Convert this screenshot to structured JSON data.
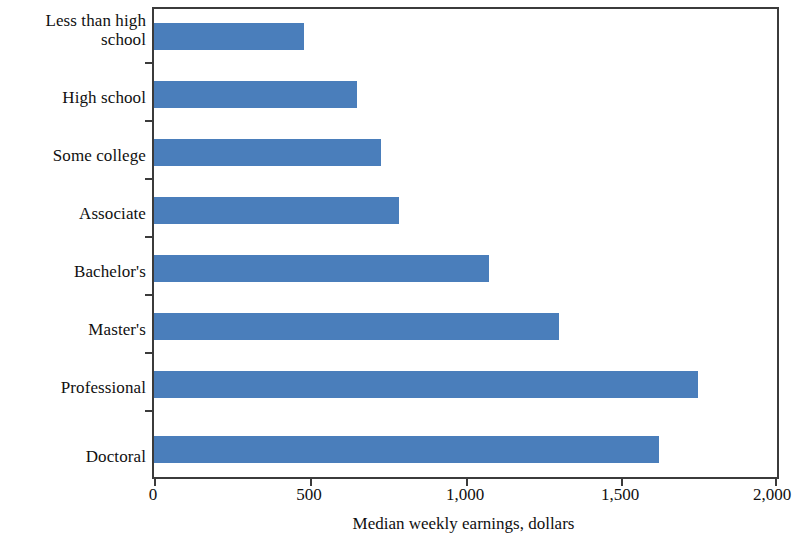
{
  "chart_data": {
    "type": "bar",
    "orientation": "horizontal",
    "title": "",
    "xlabel": "Median weekly earnings, dollars",
    "ylabel": "",
    "categories": [
      "Less than high school",
      "High school",
      "Some college",
      "Associate",
      "Bachelor's",
      "Master's",
      "Professional",
      "Doctoral"
    ],
    "values": [
      480,
      652,
      730,
      786,
      1075,
      1300,
      1745,
      1620
    ],
    "xlim": [
      0,
      2000
    ],
    "xticks": [
      0,
      500,
      1000,
      1500,
      2000
    ],
    "xtick_labels": [
      "0",
      "500",
      "1,000",
      "1,500",
      "2,000"
    ],
    "grid": false,
    "legend": false,
    "bar_color": "#4a7ebb",
    "axis_color": "#3b3b3b",
    "background": "#ffffff"
  },
  "axis": {
    "x_title": "Median weekly earnings, dollars",
    "tick_labels": [
      "0",
      "500",
      "1,000",
      "1,500",
      "2,000"
    ]
  },
  "categories": [
    {
      "label": "Less than high school",
      "value": 480
    },
    {
      "label": "High school",
      "value": 652
    },
    {
      "label": "Some college",
      "value": 730
    },
    {
      "label": "Associate",
      "value": 786
    },
    {
      "label": "Bachelor's",
      "value": 1075
    },
    {
      "label": "Master's",
      "value": 1300
    },
    {
      "label": "Professional",
      "value": 1745
    },
    {
      "label": "Doctoral",
      "value": 1620
    }
  ]
}
